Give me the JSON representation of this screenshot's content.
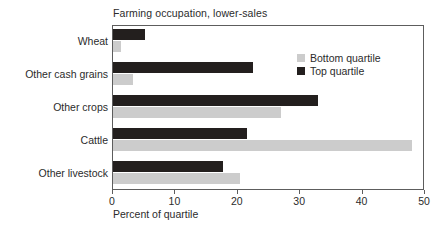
{
  "chart_data": {
    "type": "bar",
    "orientation": "horizontal",
    "title": "Farming occupation, lower-sales",
    "xlabel": "Percent of quartile",
    "ylabel": "",
    "categories": [
      "Wheat",
      "Other cash grains",
      "Other crops",
      "Cattle",
      "Other livestock"
    ],
    "series": [
      {
        "name": "Bottom quartile",
        "color": "#cccccc",
        "values": [
          1.3,
          3.2,
          27.0,
          47.9,
          20.4
        ]
      },
      {
        "name": "Top quartile",
        "color": "#231f1e",
        "values": [
          5.1,
          22.5,
          32.8,
          21.5,
          17.7
        ]
      }
    ],
    "xlim": [
      0,
      50
    ],
    "xticks": [
      0,
      10,
      20,
      30,
      40,
      50
    ],
    "xtick_labels": [
      "0",
      "10",
      "20",
      "30",
      "40",
      "50"
    ],
    "grid": false,
    "legend_position": "upper right",
    "legend_entries": [
      "Bottom quartile",
      "Top quartile"
    ]
  },
  "colors": {
    "bottom_quartile": "#cccccc",
    "top_quartile": "#231f1e",
    "axis": "#5d5d5d",
    "text": "#2b2b2b",
    "background": "#ffffff"
  }
}
